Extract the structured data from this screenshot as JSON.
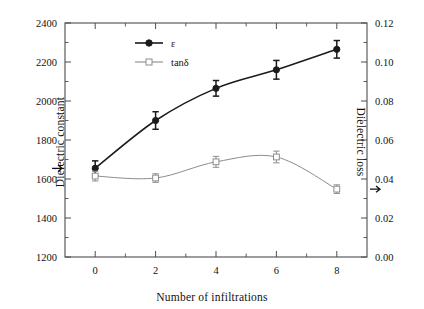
{
  "chart_data": {
    "type": "line",
    "title": "",
    "xlabel": "Number of infiltrations",
    "ylabel": "Dielectric constant",
    "ylabel_right": "Dielectric loss",
    "x": [
      0,
      2,
      4,
      6,
      8
    ],
    "xlim": [
      -1,
      9
    ],
    "xticks": [
      0,
      2,
      4,
      6,
      8
    ],
    "xticklabels": [
      "0",
      "2",
      "4",
      "6",
      "8"
    ],
    "xminorticks": [
      1,
      3,
      5,
      7
    ],
    "ylim": [
      1200,
      2400
    ],
    "yticks": [
      1200,
      1400,
      1600,
      1800,
      2000,
      2200,
      2400
    ],
    "yticklabels": [
      "1200",
      "1400",
      "1600",
      "1800",
      "2000",
      "2200",
      "2400"
    ],
    "yminorticks": [
      1300,
      1500,
      1700,
      1900,
      2100,
      2300
    ],
    "ylim_right": [
      0.0,
      0.12
    ],
    "yticks_right": [
      0.0,
      0.02,
      0.04,
      0.06,
      0.08,
      0.1,
      0.12
    ],
    "yticklabels_right": [
      "0.00",
      "0.02",
      "0.04",
      "0.06",
      "0.08",
      "0.10",
      "0.12"
    ],
    "yminorticks_right": [
      0.01,
      0.03,
      0.05,
      0.07,
      0.09,
      0.11
    ],
    "grid": false,
    "legend_position": "upper left inside",
    "series": [
      {
        "name": "ε",
        "axis": "left",
        "marker": "filled-circle",
        "color": "#1a1a1a",
        "values": [
          1655,
          1900,
          2065,
          2160,
          2265
        ],
        "errors": [
          38,
          45,
          40,
          48,
          45
        ]
      },
      {
        "name": "tanδ",
        "axis": "right",
        "marker": "open-circle",
        "color": "#8c8c8c",
        "values": [
          0.0415,
          0.0405,
          0.0488,
          0.0513,
          0.0348
        ],
        "errors": [
          0.0025,
          0.0022,
          0.0028,
          0.003,
          0.0022
        ]
      }
    ],
    "annotations": [
      {
        "text": "left-axis-arrow",
        "series": "ε",
        "x": 0
      },
      {
        "text": "right-axis-arrow",
        "series": "tanδ",
        "x": 8
      }
    ]
  },
  "labels": {
    "xlabel": "Number of infiltrations",
    "ylabel_left": "Dielectric constant",
    "ylabel_right": "Dielectric loss",
    "legend": {
      "epsilon": "ε",
      "tandelta": "tanδ"
    }
  },
  "colors": {
    "epsilon": "#1a1a1a",
    "tandelta": "#8c8c8c",
    "frame": "#4d4d4d",
    "background": "#ffffff"
  }
}
